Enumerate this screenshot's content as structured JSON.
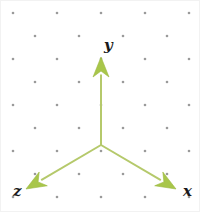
{
  "figure": {
    "width": 200,
    "height": 212,
    "background_color": "#ffffff",
    "border_color": "#f2f2f2"
  },
  "colors": {
    "axis_line": "#b5c96b",
    "arrowhead_fill": "#a8c64a",
    "arrowhead_edge": "#9cb83f",
    "label_text": "#1a1a1a",
    "grid_dot": "#9a9a9a"
  },
  "origin": {
    "label": "origin",
    "x": 101,
    "y": 145
  },
  "axes": [
    {
      "id": "y-axis",
      "label": "y",
      "direction": "up",
      "start_x": 101,
      "start_y": 145,
      "tip_x": 101,
      "tip_y": 57,
      "label_x": 104,
      "label_y": 50,
      "line_width": 2
    },
    {
      "id": "x-axis",
      "label": "x",
      "direction": "down-right",
      "start_x": 101,
      "start_y": 145,
      "tip_x": 176,
      "tip_y": 189,
      "label_x": 183,
      "label_y": 196,
      "line_width": 2
    },
    {
      "id": "z-axis",
      "label": "z",
      "direction": "down-left",
      "start_x": 101,
      "start_y": 145,
      "tip_x": 26,
      "tip_y": 189,
      "label_x": 13,
      "label_y": 196,
      "line_width": 2
    }
  ],
  "grid": {
    "type": "staggered-dot-grid",
    "dot_radius": 1.3,
    "column_spacing": 44,
    "row_spacing": 23,
    "row_offset": 22,
    "columns_even": [
      13,
      57,
      101,
      145,
      189
    ],
    "columns_odd": [
      35,
      79,
      123,
      167
    ],
    "rows": [
      13,
      36,
      59,
      82,
      105,
      128,
      151,
      174,
      197
    ]
  },
  "arrowhead": {
    "length": 20,
    "half_width": 8,
    "notch": 6
  }
}
